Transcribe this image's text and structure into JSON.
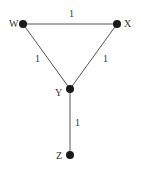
{
  "diagram": {
    "type": "graph",
    "nodes": [
      {
        "id": "W",
        "label": "W",
        "x": 23,
        "y": 24,
        "label_x": 9,
        "label_y": 27
      },
      {
        "id": "X",
        "label": "X",
        "x": 117,
        "y": 24,
        "label_x": 124,
        "label_y": 27
      },
      {
        "id": "Y",
        "label": "Y",
        "x": 70,
        "y": 89,
        "label_x": 55,
        "label_y": 96
      },
      {
        "id": "Z",
        "label": "Z",
        "x": 70,
        "y": 155,
        "label_x": 56,
        "label_y": 159
      }
    ],
    "edges": [
      {
        "from": "W",
        "to": "X",
        "weight": "1",
        "label_x": 69,
        "label_y": 17
      },
      {
        "from": "W",
        "to": "Y",
        "weight": "1",
        "label_x": 35,
        "label_y": 62
      },
      {
        "from": "X",
        "to": "Y",
        "weight": "1",
        "label_x": 103,
        "label_y": 62
      },
      {
        "from": "Y",
        "to": "Z",
        "weight": "1",
        "label_x": 75,
        "label_y": 126
      }
    ]
  }
}
